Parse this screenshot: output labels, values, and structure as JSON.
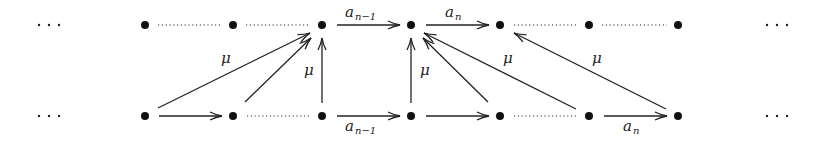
{
  "diagram": {
    "type": "commutative-diagram",
    "ellipsis": "· · ·",
    "rows": {
      "top_y": 25,
      "bottom_y": 116
    },
    "columns_x": [
      145,
      233,
      322,
      411,
      500,
      589,
      678
    ],
    "labels": {
      "a_n_minus_1_base": "a",
      "a_n_minus_1_sub": "n−1",
      "a_n_base": "a",
      "a_n_sub": "n",
      "mu": "μ"
    },
    "edges": [
      {
        "from": "bottom-0",
        "to": "top-2",
        "label": "μ",
        "kind": "arrow"
      },
      {
        "from": "bottom-1",
        "to": "top-2",
        "label": "",
        "kind": "arrow"
      },
      {
        "from": "bottom-2",
        "to": "top-2",
        "label": "μ",
        "kind": "arrow"
      },
      {
        "from": "bottom-3",
        "to": "top-3",
        "label": "μ",
        "kind": "arrow"
      },
      {
        "from": "bottom-4",
        "to": "top-3",
        "label": "",
        "kind": "arrow"
      },
      {
        "from": "bottom-5",
        "to": "top-3",
        "label": "μ",
        "kind": "arrow"
      },
      {
        "from": "bottom-6",
        "to": "top-4",
        "label": "μ",
        "kind": "arrow"
      },
      {
        "from": "top-2",
        "to": "top-3",
        "label": "a_{n-1}",
        "kind": "arrow"
      },
      {
        "from": "top-3",
        "to": "top-4",
        "label": "a_n",
        "kind": "arrow"
      },
      {
        "from": "bottom-0",
        "to": "bottom-1",
        "label": "",
        "kind": "arrow"
      },
      {
        "from": "bottom-2",
        "to": "bottom-3",
        "label": "a_{n-1}",
        "kind": "arrow"
      },
      {
        "from": "bottom-3",
        "to": "bottom-4",
        "label": "",
        "kind": "arrow"
      },
      {
        "from": "bottom-5",
        "to": "bottom-6",
        "label": "a_n",
        "kind": "arrow"
      },
      {
        "from": "top-0",
        "to": "top-1",
        "label": "",
        "kind": "dotted"
      },
      {
        "from": "top-1",
        "to": "top-2",
        "label": "",
        "kind": "dotted"
      },
      {
        "from": "top-4",
        "to": "top-5",
        "label": "",
        "kind": "dotted"
      },
      {
        "from": "top-5",
        "to": "top-6",
        "label": "",
        "kind": "dotted"
      },
      {
        "from": "bottom-1",
        "to": "bottom-2",
        "label": "",
        "kind": "dotted"
      },
      {
        "from": "bottom-4",
        "to": "bottom-5",
        "label": "",
        "kind": "dotted"
      }
    ]
  }
}
